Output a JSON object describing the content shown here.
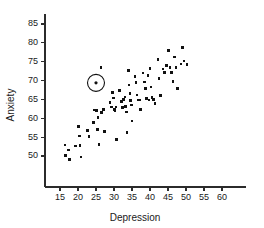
{
  "chart_data": {
    "type": "scatter",
    "title": "",
    "xlabel": "Depression",
    "ylabel": "Anxiety",
    "xlim": [
      12.5,
      62.5
    ],
    "ylim": [
      47.5,
      87.5
    ],
    "xticks": [
      15,
      20,
      25,
      30,
      35,
      40,
      45,
      50,
      55,
      60
    ],
    "yticks": [
      50,
      55,
      60,
      65,
      70,
      75,
      80,
      85
    ],
    "xtick_labels": [
      "15",
      "20",
      "25",
      "30",
      "35",
      "40",
      "45",
      "50",
      "55",
      "60"
    ],
    "ytick_labels": [
      "50",
      "55",
      "60",
      "65",
      "70",
      "75",
      "80",
      "85"
    ],
    "grid": false,
    "legend": null,
    "marker": "square",
    "marker_color": "#111111",
    "marker_size": 2.6,
    "annotations": [
      {
        "name": "circled-outlier",
        "x": 25.0,
        "y": 69.4,
        "shape": "circle",
        "radius_px": 8.5,
        "label": ""
      }
    ],
    "points": [
      {
        "x": 16.4,
        "y": 52.9
      },
      {
        "x": 16.6,
        "y": 50.2
      },
      {
        "x": 17.3,
        "y": 51.6
      },
      {
        "x": 17.6,
        "y": 49.1
      },
      {
        "x": 19.3,
        "y": 52.6
      },
      {
        "x": 20.2,
        "y": 57.8
      },
      {
        "x": 20.4,
        "y": 55.3
      },
      {
        "x": 20.6,
        "y": 52.8
      },
      {
        "x": 20.8,
        "y": 49.7
      },
      {
        "x": 22.7,
        "y": 56.8
      },
      {
        "x": 23.1,
        "y": 55.2
      },
      {
        "x": 24.3,
        "y": 58.9
      },
      {
        "x": 24.6,
        "y": 62.2
      },
      {
        "x": 25.0,
        "y": 69.4
      },
      {
        "x": 25.2,
        "y": 62.0
      },
      {
        "x": 25.4,
        "y": 57.0
      },
      {
        "x": 25.6,
        "y": 60.2
      },
      {
        "x": 25.8,
        "y": 53.1
      },
      {
        "x": 26.4,
        "y": 73.4
      },
      {
        "x": 26.6,
        "y": 61.6
      },
      {
        "x": 27.0,
        "y": 62.3
      },
      {
        "x": 27.3,
        "y": 56.5
      },
      {
        "x": 28.9,
        "y": 64.2
      },
      {
        "x": 29.3,
        "y": 63.0
      },
      {
        "x": 29.6,
        "y": 66.9
      },
      {
        "x": 29.8,
        "y": 65.4
      },
      {
        "x": 30.1,
        "y": 62.3
      },
      {
        "x": 30.3,
        "y": 61.9
      },
      {
        "x": 30.5,
        "y": 63.0
      },
      {
        "x": 30.7,
        "y": 54.3
      },
      {
        "x": 31.6,
        "y": 67.4
      },
      {
        "x": 32.1,
        "y": 64.4
      },
      {
        "x": 32.4,
        "y": 62.9
      },
      {
        "x": 32.7,
        "y": 65.0
      },
      {
        "x": 33.0,
        "y": 65.6
      },
      {
        "x": 33.2,
        "y": 63.1
      },
      {
        "x": 33.4,
        "y": 61.7
      },
      {
        "x": 33.6,
        "y": 56.2
      },
      {
        "x": 34.0,
        "y": 72.6
      },
      {
        "x": 34.2,
        "y": 68.8
      },
      {
        "x": 34.4,
        "y": 66.5
      },
      {
        "x": 34.6,
        "y": 64.7
      },
      {
        "x": 34.8,
        "y": 63.5
      },
      {
        "x": 35.0,
        "y": 59.3
      },
      {
        "x": 35.8,
        "y": 71.1
      },
      {
        "x": 36.1,
        "y": 69.5
      },
      {
        "x": 36.4,
        "y": 66.2
      },
      {
        "x": 36.7,
        "y": 64.8
      },
      {
        "x": 37.0,
        "y": 64.9
      },
      {
        "x": 37.3,
        "y": 62.4
      },
      {
        "x": 38.1,
        "y": 72.0
      },
      {
        "x": 38.4,
        "y": 69.6
      },
      {
        "x": 38.7,
        "y": 67.9
      },
      {
        "x": 39.0,
        "y": 65.2
      },
      {
        "x": 39.4,
        "y": 71.4
      },
      {
        "x": 39.7,
        "y": 64.9
      },
      {
        "x": 40.0,
        "y": 73.2
      },
      {
        "x": 40.3,
        "y": 68.3
      },
      {
        "x": 40.6,
        "y": 65.5
      },
      {
        "x": 41.0,
        "y": 65.0
      },
      {
        "x": 41.4,
        "y": 64.0
      },
      {
        "x": 42.2,
        "y": 75.6
      },
      {
        "x": 42.5,
        "y": 70.6
      },
      {
        "x": 42.9,
        "y": 66.0
      },
      {
        "x": 43.6,
        "y": 73.1
      },
      {
        "x": 44.1,
        "y": 72.2
      },
      {
        "x": 44.5,
        "y": 74.0
      },
      {
        "x": 45.1,
        "y": 78.0
      },
      {
        "x": 45.6,
        "y": 73.4
      },
      {
        "x": 46.0,
        "y": 72.1
      },
      {
        "x": 46.4,
        "y": 69.8
      },
      {
        "x": 46.8,
        "y": 76.2
      },
      {
        "x": 47.2,
        "y": 73.5
      },
      {
        "x": 47.6,
        "y": 67.9
      },
      {
        "x": 48.6,
        "y": 74.4
      },
      {
        "x": 49.0,
        "y": 78.8
      },
      {
        "x": 49.4,
        "y": 75.2
      },
      {
        "x": 50.3,
        "y": 74.2
      }
    ]
  }
}
